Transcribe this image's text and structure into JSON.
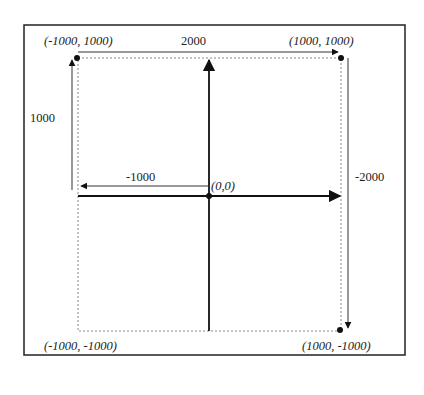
{
  "diagram": {
    "type": "coordinate-system",
    "corners": {
      "top_left": "(-1000, 1000)",
      "top_right": "(1000, 1000)",
      "bottom_left": "(-1000, -1000)",
      "bottom_right": "(1000, -1000)"
    },
    "origin": "(0,0)",
    "dimensions": {
      "top_width": "2000",
      "left_height": "1000",
      "middle_width": "-1000",
      "right_height": "-2000"
    },
    "colors": {
      "line": "#111111",
      "dotted": "#888888",
      "border": "#222222"
    }
  }
}
